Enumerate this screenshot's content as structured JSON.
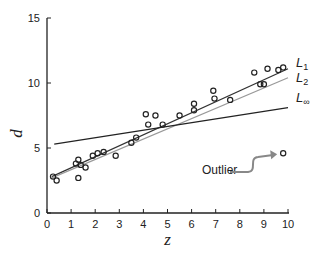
{
  "chart_data": {
    "type": "scatter",
    "title": "",
    "xlabel": "z",
    "ylabel": "d",
    "xlim": [
      0,
      10
    ],
    "ylim": [
      0,
      15
    ],
    "x_ticks": [
      0,
      1,
      2,
      3,
      4,
      5,
      6,
      7,
      8,
      9,
      10
    ],
    "y_ticks": [
      0,
      5,
      10,
      15
    ],
    "grid": false,
    "series": [
      {
        "name": "observations",
        "kind": "points",
        "marker": "open-circle",
        "color": "#222222",
        "points": [
          [
            0.25,
            2.8
          ],
          [
            0.4,
            2.5
          ],
          [
            1.2,
            3.8
          ],
          [
            1.3,
            4.1
          ],
          [
            1.4,
            3.7
          ],
          [
            1.6,
            3.5
          ],
          [
            1.3,
            2.7
          ],
          [
            1.9,
            4.4
          ],
          [
            2.1,
            4.6
          ],
          [
            2.35,
            4.7
          ],
          [
            2.85,
            4.4
          ],
          [
            3.5,
            5.4
          ],
          [
            3.7,
            5.8
          ],
          [
            4.1,
            7.6
          ],
          [
            4.5,
            7.5
          ],
          [
            4.2,
            6.8
          ],
          [
            4.8,
            6.8
          ],
          [
            5.5,
            7.5
          ],
          [
            6.1,
            8.4
          ],
          [
            6.1,
            7.9
          ],
          [
            6.9,
            9.4
          ],
          [
            6.95,
            8.8
          ],
          [
            7.6,
            8.7
          ],
          [
            8.6,
            10.8
          ],
          [
            8.85,
            9.9
          ],
          [
            9.0,
            9.9
          ],
          [
            9.15,
            11.1
          ],
          [
            9.6,
            11.0
          ],
          [
            9.8,
            11.2
          ]
        ]
      },
      {
        "name": "outlier",
        "kind": "points",
        "marker": "open-circle",
        "color": "#222222",
        "points": [
          [
            9.8,
            4.6
          ]
        ]
      },
      {
        "name": "L1",
        "label_main": "L",
        "label_sub": "1",
        "kind": "line",
        "color": "#333333",
        "x": [
          0.2,
          10.0
        ],
        "y": [
          2.8,
          11.1
        ]
      },
      {
        "name": "L2",
        "label_main": "L",
        "label_sub": "2",
        "kind": "line",
        "color": "#999999",
        "x": [
          0.2,
          10.0
        ],
        "y": [
          2.7,
          10.4
        ]
      },
      {
        "name": "L-infinity",
        "label_main": "L",
        "label_sub": "∞",
        "kind": "line",
        "color": "#222222",
        "x": [
          0.3,
          10.0
        ],
        "y": [
          5.3,
          8.1
        ]
      }
    ],
    "annotations": [
      {
        "text": "Outlier",
        "target": [
          9.8,
          4.6
        ],
        "arrow_color": "#888888"
      }
    ]
  }
}
